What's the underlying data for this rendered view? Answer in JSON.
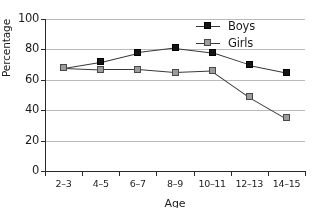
{
  "chart_data": {
    "type": "line",
    "title": "",
    "xlabel": "Age",
    "ylabel": "Percentage",
    "categories": [
      "2–3",
      "4–5",
      "6–7",
      "8–9",
      "10–11",
      "12–13",
      "14–15"
    ],
    "ylim": [
      0,
      100
    ],
    "yticks": [
      0,
      20,
      40,
      60,
      80,
      100
    ],
    "grid": true,
    "legend_position": "top-right",
    "series": [
      {
        "name": "Boys",
        "color": "#161616",
        "marker": "filled-square",
        "values": [
          68,
          72,
          78,
          81,
          78,
          70,
          65
        ]
      },
      {
        "name": "Girls",
        "color": "#9b9b9b",
        "marker": "gray-square",
        "values": [
          68,
          67,
          67,
          65,
          66,
          49,
          35
        ]
      }
    ]
  },
  "legend": {
    "items": [
      {
        "label": "Boys"
      },
      {
        "label": "Girls"
      }
    ]
  },
  "axes": {
    "y_title": "Percentage",
    "x_title": "Age",
    "y_tick_labels": [
      "0",
      "20",
      "40",
      "60",
      "80",
      "100"
    ],
    "x_tick_labels": [
      "2–3",
      "4–5",
      "6–7",
      "8–9",
      "10–11",
      "12–13",
      "14–15"
    ]
  }
}
